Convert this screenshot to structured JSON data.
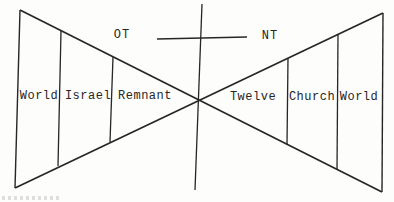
{
  "diagram": {
    "era_labels": {
      "left": "OT",
      "right": "NT"
    },
    "left_triangle": {
      "segments": [
        "World",
        "Israel",
        "Remnant"
      ]
    },
    "right_triangle": {
      "segments": [
        "Twelve",
        "Church",
        "World"
      ]
    },
    "colors": {
      "line": "#262626",
      "background": "#fdfdfb",
      "text": "#262626"
    }
  }
}
